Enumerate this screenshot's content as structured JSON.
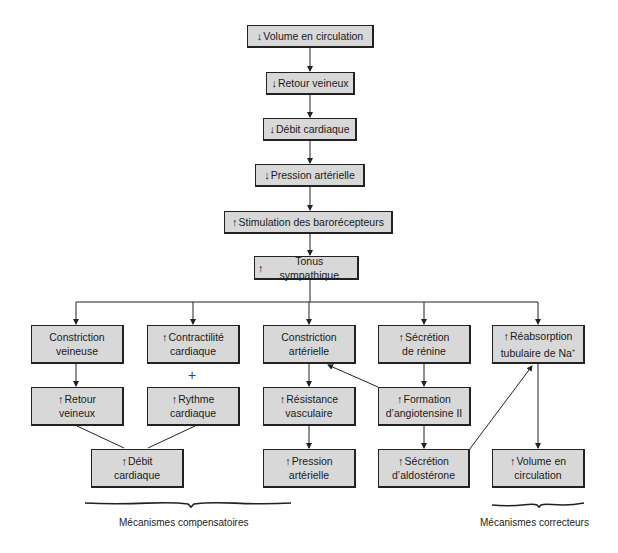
{
  "diagram": {
    "chain": [
      {
        "id": "volume-circulation-decrease",
        "arrow": "↓",
        "text": "Volume en circulation"
      },
      {
        "id": "retour-veineux-decrease",
        "arrow": "↓",
        "text": "Retour veineux"
      },
      {
        "id": "debit-cardiaque-decrease",
        "arrow": "↓",
        "text": "Débit cardiaque"
      },
      {
        "id": "pression-arterielle-decrease",
        "arrow": "↓",
        "text": "Pression artérielle"
      },
      {
        "id": "stimulation-barorecepteurs-increase",
        "arrow": "↑",
        "text": "Stimulation des barorécepteurs"
      },
      {
        "id": "tonus-sympathique-increase",
        "arrow": "↑",
        "text": "Tonus sympathique"
      }
    ],
    "branches": {
      "constriction_veineuse": {
        "arrow": "",
        "text": "Constriction\nveineuse"
      },
      "contractilite_cardiaque": {
        "arrow": "↑",
        "text": "Contractilité\ncardiaque"
      },
      "constriction_arterielle": {
        "arrow": "",
        "text": "Constriction\nartérielle"
      },
      "secretion_renine": {
        "arrow": "↑",
        "text": "Sécrétion\nde rénine"
      },
      "reabsorption_na": {
        "arrow": "↑",
        "text": "Réabsorption\ntubulaire de Na",
        "sup": "+"
      },
      "retour_veineux": {
        "arrow": "↑",
        "text": "Retour\nveineux"
      },
      "rythme_cardiaque": {
        "arrow": "↑",
        "text": "Rythme\ncardiaque"
      },
      "resistance_vasculaire": {
        "arrow": "↑",
        "text": "Résistance\nvasculaire"
      },
      "formation_angiotensine": {
        "arrow": "↑",
        "text": "Formation\nd’angiotensine II"
      },
      "debit_cardiaque": {
        "arrow": "↑",
        "text": "Débit\ncardiaque"
      },
      "pression_arterielle": {
        "arrow": "↑",
        "text": "Pression\nartérielle"
      },
      "secretion_aldosterone": {
        "arrow": "↑",
        "text": "Sécrétion\nd’aldostérone"
      },
      "volume_circulation": {
        "arrow": "↑",
        "text": "Volume en\ncirculation"
      }
    },
    "plus_sign": "+",
    "groups": {
      "compensatoires": "Mécanismes compensatoires",
      "correcteurs": "Mécanismes correcteurs"
    },
    "colors": {
      "box_fill": "#d8d8d8",
      "line": "#222222"
    }
  }
}
